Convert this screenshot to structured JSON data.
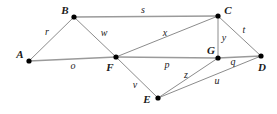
{
  "figure": {
    "kind": "undirected-graph-diagram",
    "width": 277,
    "height": 114,
    "background_color": "#ffffff",
    "edge_color": "#8c8c8c",
    "vertex_color": "#000000",
    "label_color": "#1a1a1a"
  },
  "vertices": [
    {
      "id": "A",
      "label": "A",
      "x": 29,
      "y": 61,
      "label_x": 20,
      "label_y": 54
    },
    {
      "id": "B",
      "label": "B",
      "x": 74,
      "y": 17,
      "label_x": 65,
      "label_y": 10
    },
    {
      "id": "C",
      "label": "C",
      "x": 218,
      "y": 16,
      "label_x": 228,
      "label_y": 10
    },
    {
      "id": "D",
      "label": "D",
      "x": 261,
      "y": 56,
      "label_x": 262,
      "label_y": 67
    },
    {
      "id": "E",
      "label": "E",
      "x": 158,
      "y": 98,
      "label_x": 147,
      "label_y": 99
    },
    {
      "id": "F",
      "label": "F",
      "x": 116,
      "y": 57,
      "label_x": 110,
      "label_y": 67
    },
    {
      "id": "G",
      "label": "G",
      "x": 218,
      "y": 58,
      "label_x": 211,
      "label_y": 50
    }
  ],
  "edges": [
    {
      "id": "r",
      "label": "r",
      "from": "A",
      "to": "B",
      "label_x": 47,
      "label_y": 32,
      "weight": "thin"
    },
    {
      "id": "s",
      "label": "s",
      "from": "B",
      "to": "C",
      "label_x": 143,
      "label_y": 10,
      "weight": "heavy"
    },
    {
      "id": "w",
      "label": "w",
      "from": "B",
      "to": "F",
      "label_x": 104,
      "label_y": 33,
      "weight": "thin"
    },
    {
      "id": "o",
      "label": "o",
      "from": "A",
      "to": "F",
      "label_x": 73,
      "label_y": 66,
      "weight": "heavy"
    },
    {
      "id": "x",
      "label": "x",
      "from": "F",
      "to": "C",
      "label_x": 165,
      "label_y": 33,
      "weight": "thin"
    },
    {
      "id": "p",
      "label": "p",
      "from": "F",
      "to": "G",
      "label_x": 167,
      "label_y": 65,
      "weight": "heavy"
    },
    {
      "id": "v",
      "label": "v",
      "from": "F",
      "to": "E",
      "label_x": 135,
      "label_y": 85,
      "weight": "thin"
    },
    {
      "id": "y",
      "label": "y",
      "from": "C",
      "to": "G",
      "label_x": 224,
      "label_y": 38,
      "weight": "thin"
    },
    {
      "id": "t",
      "label": "t",
      "from": "C",
      "to": "D",
      "label_x": 244,
      "label_y": 30,
      "weight": "thin"
    },
    {
      "id": "q",
      "label": "q",
      "from": "G",
      "to": "D",
      "label_x": 233,
      "label_y": 62,
      "weight": "heavy"
    },
    {
      "id": "z",
      "label": "z",
      "from": "E",
      "to": "G",
      "label_x": 186,
      "label_y": 75,
      "weight": "thin"
    },
    {
      "id": "u",
      "label": "u",
      "from": "E",
      "to": "D",
      "label_x": 217,
      "label_y": 81,
      "weight": "thin"
    }
  ]
}
